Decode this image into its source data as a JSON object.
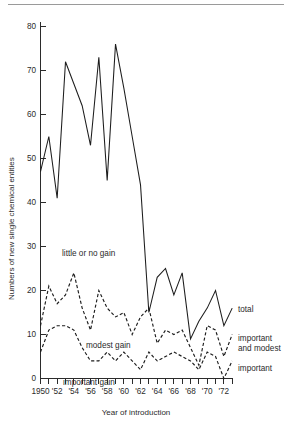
{
  "figure": {
    "background": "#ffffff",
    "ink_color": "#1d1d1d"
  },
  "axes": {
    "y_title": "Numbers of new single chemical entities",
    "x_title": "Year of introduction",
    "y_ticks": [
      "0",
      "10",
      "20",
      "30",
      "40",
      "50",
      "60",
      "70",
      "80"
    ],
    "x_tick_labels": [
      "1950",
      "'52",
      "'54",
      "'56",
      "'58",
      "'60",
      "'62",
      "'64",
      "'66",
      "'68",
      "'70",
      "'72"
    ]
  },
  "annotations": [
    {
      "id": "little-or-no-gain",
      "text": "little or no gain"
    },
    {
      "id": "modest-gain",
      "text": "modest gain"
    },
    {
      "id": "important-gain",
      "text": "important gain"
    }
  ],
  "legend": [
    {
      "id": "total",
      "text": "total"
    },
    {
      "id": "important-and-modest",
      "line1": "important",
      "line2": "and modest"
    },
    {
      "id": "important",
      "text": "important"
    }
  ],
  "chart_data": {
    "type": "line",
    "title": "",
    "xlabel": "Year of introduction",
    "ylabel": "Numbers of new single chemical entities",
    "xlim": [
      1950,
      1973
    ],
    "ylim": [
      0,
      80
    ],
    "grid": false,
    "legend_position": "right",
    "x": [
      1950,
      1951,
      1952,
      1953,
      1954,
      1955,
      1956,
      1957,
      1958,
      1959,
      1960,
      1961,
      1962,
      1963,
      1964,
      1965,
      1966,
      1967,
      1968,
      1969,
      1970,
      1971,
      1972,
      1973
    ],
    "series": [
      {
        "name": "total",
        "style": "solid",
        "values": [
          47,
          55,
          41,
          72,
          67,
          62,
          53,
          73,
          45,
          76,
          66,
          55,
          44,
          15,
          23,
          25,
          19,
          24,
          9,
          13,
          16,
          20,
          12,
          16
        ]
      },
      {
        "name": "important and modest",
        "style": "dashed",
        "values": [
          12,
          21,
          17,
          19,
          24,
          16,
          11,
          20,
          16,
          14,
          15,
          10,
          14,
          16,
          8,
          11,
          10,
          11,
          7,
          3,
          12,
          11,
          5,
          10
        ]
      },
      {
        "name": "important",
        "style": "dashed",
        "values": [
          6,
          11,
          12,
          12,
          11,
          7,
          4,
          4,
          6,
          4,
          6,
          4,
          2,
          6,
          4,
          5,
          6,
          5,
          4,
          2,
          6,
          5,
          0,
          4
        ]
      }
    ]
  }
}
